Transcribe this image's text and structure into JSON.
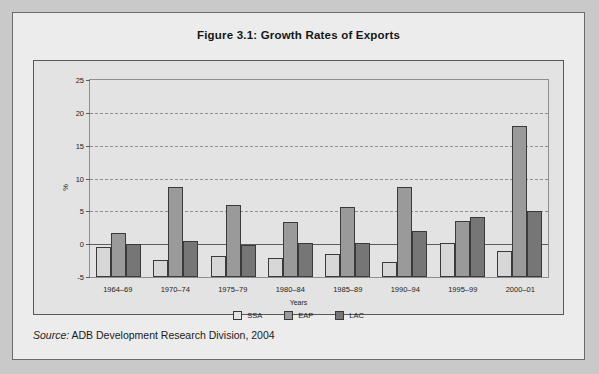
{
  "figure": {
    "title": "Figure 3.1:  Growth Rates of Exports",
    "source_key": "Source:",
    "source_value": " ADB Development Research Division, 2004"
  },
  "chart_data": {
    "type": "bar",
    "title": "Figure 3.1:  Growth Rates of Exports",
    "xlabel": "Years",
    "ylabel": "%",
    "ylim": [
      -5,
      25
    ],
    "yticks": [
      25,
      20,
      15,
      10,
      5,
      0,
      -5
    ],
    "grid": true,
    "legend_position": "bottom",
    "categories": [
      "1964–69",
      "1970–74",
      "1975–79",
      "1980–84",
      "1985–89",
      "1990–94",
      "1995–99",
      "2000–01"
    ],
    "series": [
      {
        "name": "SSA",
        "color": "#d7d7d7",
        "values": [
          4.5,
          2.5,
          3.2,
          2.8,
          3.4,
          2.2,
          5.2,
          3.9
        ]
      },
      {
        "name": "EAP",
        "color": "#9a9a9a",
        "values": [
          6.6,
          13.5,
          10.9,
          8.3,
          10.6,
          13.5,
          8.5,
          22.8
        ]
      },
      {
        "name": "LAC",
        "color": "#767676",
        "values": [
          5.0,
          5.4,
          4.9,
          5.2,
          5.2,
          6.9,
          9.1,
          10.0
        ]
      }
    ]
  }
}
